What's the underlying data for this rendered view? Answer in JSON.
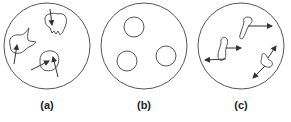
{
  "panels": [
    {
      "label": "(a)",
      "description": "irregular shapes with arrows"
    },
    {
      "label": "(b)",
      "description": "three small circles"
    },
    {
      "label": "(c)",
      "description": "elongated shapes with double arrows"
    }
  ],
  "colors": {
    "stroke": "#444444",
    "background": "#ffffff"
  }
}
